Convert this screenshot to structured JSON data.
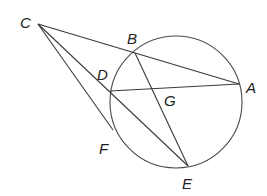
{
  "diagram": {
    "type": "geometry",
    "circle": {
      "cx": 176,
      "cy": 102,
      "r": 66
    },
    "points": [
      {
        "name": "C",
        "x": 38,
        "y": 24,
        "label_x": 20,
        "label_y": 28
      },
      {
        "name": "B",
        "x": 135,
        "y": 53,
        "label_x": 127,
        "label_y": 44
      },
      {
        "name": "A",
        "x": 239,
        "y": 84,
        "label_x": 246,
        "label_y": 93
      },
      {
        "name": "D",
        "x": 110,
        "y": 91,
        "label_x": 97,
        "label_y": 80
      },
      {
        "name": "G",
        "x": 152,
        "y": 89,
        "label_x": 164,
        "label_y": 106
      },
      {
        "name": "F",
        "x": 113,
        "y": 130,
        "label_x": 99,
        "label_y": 154
      },
      {
        "name": "E",
        "x": 188,
        "y": 166,
        "label_x": 182,
        "label_y": 189
      }
    ],
    "segments": [
      [
        "C",
        "A"
      ],
      [
        "C",
        "E"
      ],
      [
        "C",
        "F"
      ],
      [
        "D",
        "A"
      ],
      [
        "B",
        "E"
      ]
    ],
    "stroke_color": "#3a3a3a"
  }
}
